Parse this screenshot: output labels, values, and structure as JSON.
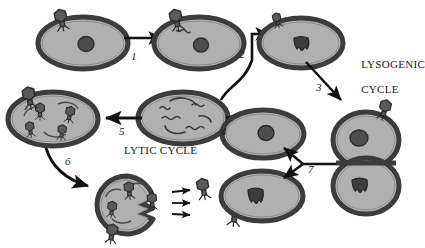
{
  "figure": {
    "background_color": "#fefefe",
    "ink_color": "#1a1a1a",
    "cell_wall_color": "#4a4a4a",
    "cytoplasm_color": "#b5b5b5",
    "phage_color": "#555555",
    "width": 423,
    "height": 248
  },
  "cycle_labels": [
    {
      "id": "lysogenic",
      "line1": "LYSOGENIC",
      "line2": "CYCLE",
      "x": 349,
      "y": 53
    },
    {
      "id": "lytic",
      "text": "LYTIC CYCLE",
      "x": 124,
      "y": 145
    }
  ],
  "step_labels": [
    {
      "id": "step-1",
      "text": "1",
      "x": 131,
      "y": 50
    },
    {
      "id": "step-2",
      "text": "2",
      "x": 239,
      "y": 48
    },
    {
      "id": "step-3",
      "text": "3",
      "x": 316,
      "y": 81
    },
    {
      "id": "step-4",
      "text": "4",
      "x": 221,
      "y": 125
    },
    {
      "id": "step-5",
      "text": "5",
      "x": 119,
      "y": 125
    },
    {
      "id": "step-6",
      "text": "6",
      "x": 65,
      "y": 155
    },
    {
      "id": "step-7",
      "text": "7",
      "x": 308,
      "y": 163
    }
  ],
  "cells": [
    {
      "id": "cell-attachment",
      "label": "bacterium with phage attached",
      "cx": 83,
      "cy": 42
    },
    {
      "id": "cell-injection",
      "label": "bacterium with phage DNA injected",
      "cx": 199,
      "cy": 42
    },
    {
      "id": "cell-integrated",
      "label": "bacterium with prophage integrated",
      "cx": 301,
      "cy": 43
    },
    {
      "id": "cell-dividing",
      "label": "dividing lysogenic bacteria",
      "cx": 366,
      "cy": 163
    },
    {
      "id": "cell-daughter",
      "label": "daughter bacterium with prophage",
      "cx": 262,
      "cy": 196
    },
    {
      "id": "cell-induced",
      "label": "induced bacterium with phage DNA",
      "cx": 263,
      "cy": 137
    },
    {
      "id": "cell-replication",
      "label": "bacterium with replicating phage DNA",
      "cx": 183,
      "cy": 118
    },
    {
      "id": "cell-assembly",
      "label": "bacterium with assembled phage particles",
      "cx": 53,
      "cy": 118
    },
    {
      "id": "cell-lysis",
      "label": "lysing bacterium releasing phages",
      "cx": 127,
      "cy": 205
    }
  ],
  "free_phages": [
    {
      "id": "free-phage-1",
      "cx": 235,
      "cy": 190
    },
    {
      "id": "free-phage-2",
      "cx": 263,
      "cy": 215
    },
    {
      "id": "free-phage-3",
      "cx": 307,
      "cy": 196
    }
  ],
  "arrows": [
    {
      "id": "arrow-1",
      "style": "straight",
      "from": [
        124,
        38
      ],
      "to": [
        165,
        38
      ]
    },
    {
      "id": "arrow-2",
      "style": "curved",
      "from": [
        228,
        96
      ],
      "to": [
        273,
        33
      ]
    },
    {
      "id": "arrow-3",
      "style": "straight",
      "from": [
        307,
        63
      ],
      "to": [
        344,
        102
      ]
    },
    {
      "id": "arrow-4",
      "style": "straight",
      "from": [
        250,
        118
      ],
      "to": [
        224,
        118
      ]
    },
    {
      "id": "arrow-5",
      "style": "straight",
      "from": [
        142,
        118
      ],
      "to": [
        104,
        118
      ]
    },
    {
      "id": "arrow-6",
      "style": "curved",
      "from": [
        47,
        145
      ],
      "to": [
        95,
        185
      ]
    },
    {
      "id": "arrow-7",
      "style": "forked",
      "from": [
        335,
        164
      ],
      "to": [
        282,
        148
      ]
    },
    {
      "id": "release-arrow-1",
      "style": "tiny",
      "from": [
        190,
        192
      ],
      "to": [
        207,
        190
      ]
    },
    {
      "id": "release-arrow-2",
      "style": "tiny",
      "from": [
        190,
        202
      ],
      "to": [
        207,
        202
      ]
    },
    {
      "id": "release-arrow-3",
      "style": "tiny",
      "from": [
        190,
        212
      ],
      "to": [
        207,
        213
      ]
    }
  ]
}
